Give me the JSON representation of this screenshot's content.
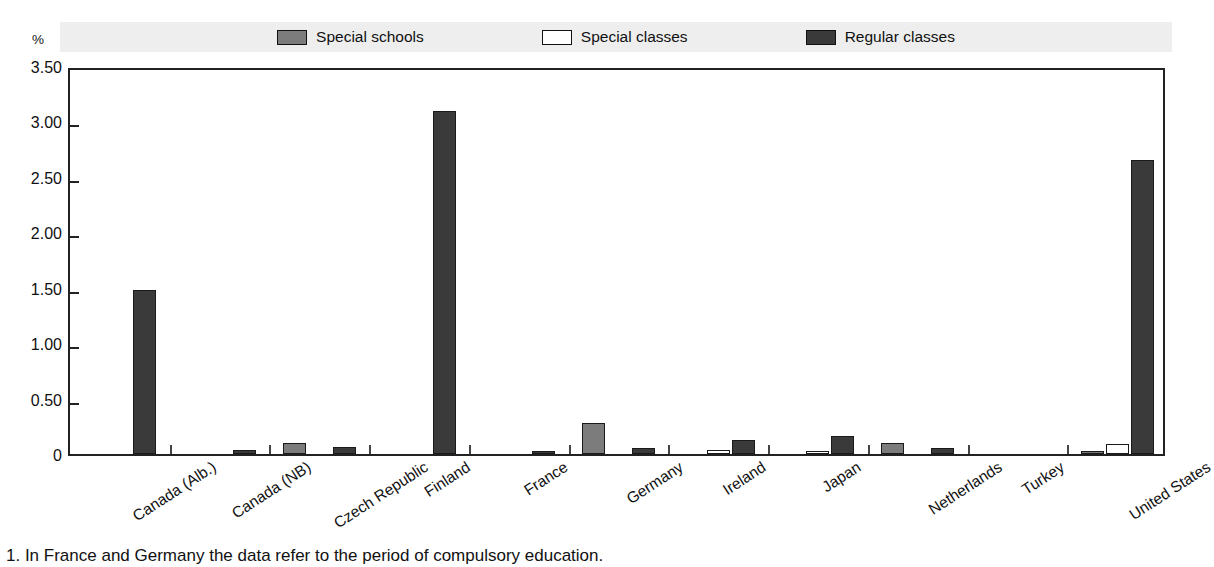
{
  "legend": {
    "items": [
      {
        "label": "Special schools",
        "color": "#7c7c7c",
        "key": "special_schools"
      },
      {
        "label": "Special classes",
        "color": "#ffffff",
        "key": "special_classes"
      },
      {
        "label": "Regular classes",
        "color": "#3a3a3a",
        "key": "regular_classes"
      }
    ]
  },
  "axis": {
    "unit": "%",
    "y_ticks": [
      "3.50",
      "3.00",
      "2.50",
      "2.00",
      "1.50",
      "1.00",
      "0.50",
      "0"
    ]
  },
  "footnote": "1. In France and Germany the data refer to the period of compulsory education.",
  "chart_data": {
    "type": "bar",
    "title": "",
    "subtitle": "",
    "xlabel": "",
    "ylabel": "%",
    "ylim": [
      0,
      3.5
    ],
    "ytick_values": [
      3.5,
      3.0,
      2.5,
      2.0,
      1.5,
      1.0,
      0.5,
      0
    ],
    "grid": false,
    "legend_position": "top-center",
    "categories": [
      "Canada (Alb.)",
      "Canada (NB)",
      "Czech Republic",
      "Finland",
      "France",
      "Germany",
      "Ireland",
      "Japan",
      "Netherlands",
      "Turkey",
      "United States"
    ],
    "series": [
      {
        "name": "Special schools",
        "color": "#7c7c7c",
        "values": [
          0,
          0,
          0.1,
          0,
          0,
          0.28,
          0,
          0,
          0.1,
          0,
          0.02
        ]
      },
      {
        "name": "Special classes",
        "color": "#ffffff",
        "values": [
          0,
          0,
          0,
          0,
          0,
          0,
          0.04,
          0.02,
          0,
          0,
          0.09
        ]
      },
      {
        "name": "Regular classes",
        "color": "#3a3a3a",
        "values": [
          1.48,
          0.04,
          0.06,
          3.09,
          0.03,
          0.05,
          0.13,
          0.16,
          0.05,
          0,
          2.65
        ]
      }
    ]
  }
}
